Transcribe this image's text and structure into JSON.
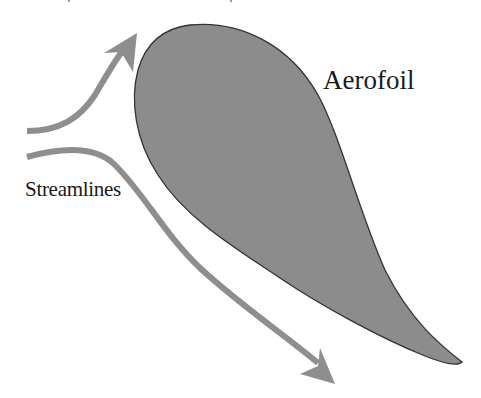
{
  "diagram": {
    "title": "",
    "labels": {
      "aerofoil": "Aerofoil",
      "streamlines": "Streamlines"
    },
    "colors": {
      "background": "#ffffff",
      "aerofoil_fill": "#8c8c8c",
      "aerofoil_outline": "#333333",
      "streamline": "#8e8e8e",
      "text": "#1a1a1a"
    },
    "elements": [
      {
        "id": "aerofoil",
        "type": "shape",
        "description": "Teardrop aerofoil cross-section, rounded leading edge at top-left, tapering to trailing-edge tip at bottom-right"
      },
      {
        "id": "upper-streamline",
        "type": "arrow",
        "description": "Curved arrow from left sweeping up over the leading edge"
      },
      {
        "id": "lower-streamline",
        "type": "arrow",
        "description": "Curved arrow from left sweeping down beneath the aerofoil toward bottom-right"
      }
    ]
  }
}
